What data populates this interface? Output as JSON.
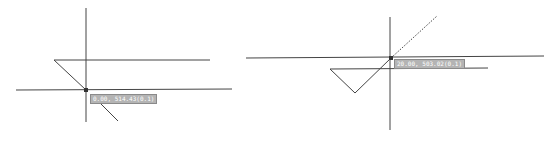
{
  "panels": [
    {
      "name": "left",
      "tooltip": "0.00, 514.43(0.1)",
      "snap_point": [
        86,
        90
      ],
      "lines": [
        {
          "x1": 86,
          "y1": 8,
          "x2": 86,
          "y2": 122,
          "style": "solid"
        },
        {
          "x1": 54,
          "y1": 60,
          "x2": 210,
          "y2": 60,
          "style": "solid"
        },
        {
          "x1": 16,
          "y1": 90,
          "x2": 232,
          "y2": 89,
          "style": "solid"
        },
        {
          "x1": 54,
          "y1": 60,
          "x2": 86,
          "y2": 90,
          "style": "solid"
        },
        {
          "x1": 97,
          "y1": 100,
          "x2": 118,
          "y2": 121,
          "style": "solid"
        }
      ],
      "tooltip_pos": [
        90,
        95
      ]
    },
    {
      "name": "right",
      "tooltip": "20.00, 503.02(0.1)",
      "snap_point": [
        391,
        58
      ],
      "lines": [
        {
          "x1": 390,
          "y1": 17,
          "x2": 390,
          "y2": 130,
          "style": "solid"
        },
        {
          "x1": 246,
          "y1": 58,
          "x2": 544,
          "y2": 56,
          "style": "solid"
        },
        {
          "x1": 330,
          "y1": 69,
          "x2": 488,
          "y2": 68,
          "style": "solid"
        },
        {
          "x1": 330,
          "y1": 69,
          "x2": 355,
          "y2": 93,
          "style": "solid"
        },
        {
          "x1": 355,
          "y1": 93,
          "x2": 391,
          "y2": 58,
          "style": "solid"
        },
        {
          "x1": 391,
          "y1": 58,
          "x2": 437,
          "y2": 16,
          "style": "dotted"
        }
      ],
      "tooltip_pos": [
        394,
        59
      ]
    }
  ],
  "colors": {
    "line": "#444444",
    "tooltip_bg": "#b4b4b4",
    "tooltip_text": "#ffffff"
  }
}
